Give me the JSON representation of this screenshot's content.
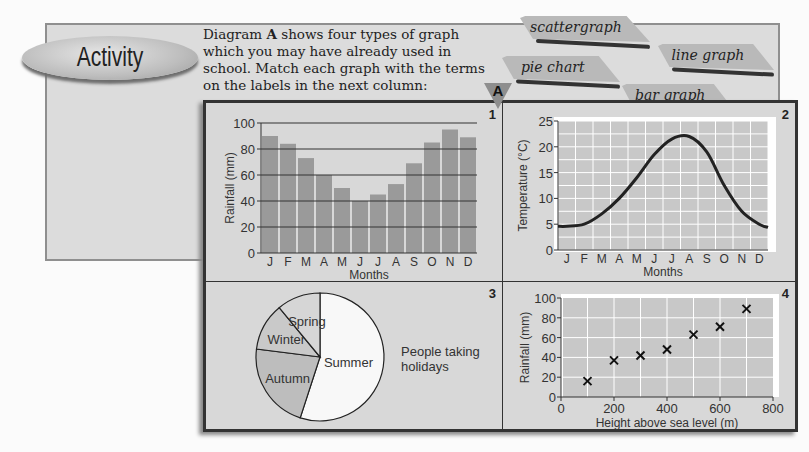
{
  "activity": {
    "label": "Activity"
  },
  "intro": {
    "text_before": "Diagram ",
    "bold": "A",
    "text_after": " shows four types of graph which you may have already used in school. Match each graph with the terms on the labels in the next column:"
  },
  "tags": [
    {
      "label": "scattergraph"
    },
    {
      "label": "pie chart"
    },
    {
      "label": "line graph"
    },
    {
      "label": "bar graph"
    }
  ],
  "diagram": {
    "marker": "A",
    "panels": [
      {
        "number": "1"
      },
      {
        "number": "2"
      },
      {
        "number": "3"
      },
      {
        "number": "4"
      }
    ]
  },
  "chart_data": [
    {
      "type": "bar",
      "title": "",
      "categories": [
        "J",
        "F",
        "M",
        "A",
        "M",
        "J",
        "J",
        "A",
        "S",
        "O",
        "N",
        "D"
      ],
      "values": [
        90,
        84,
        73,
        60,
        50,
        40,
        45,
        53,
        69,
        85,
        95,
        89
      ],
      "xlabel": "Months",
      "ylabel": "Rainfall (mm)",
      "ylim": [
        0,
        100
      ],
      "yticks": [
        0,
        20,
        40,
        60,
        80,
        100
      ],
      "grid": true,
      "color": "#9a9a9a"
    },
    {
      "type": "line",
      "title": "",
      "categories": [
        "J",
        "F",
        "M",
        "A",
        "M",
        "J",
        "J",
        "A",
        "S",
        "O",
        "N",
        "D"
      ],
      "values": [
        4.6,
        5,
        7,
        10,
        14,
        18.5,
        21.5,
        22,
        19,
        12.5,
        7.5,
        5
      ],
      "xlabel": "Months",
      "ylabel": "Temperature (°C)",
      "ylim": [
        0,
        25
      ],
      "yticks": [
        0,
        5,
        10,
        15,
        20,
        25
      ],
      "grid": true
    },
    {
      "type": "pie",
      "title": "People taking holidays",
      "categories": [
        "Summer",
        "Autumn",
        "Winter",
        "Spring"
      ],
      "values": [
        55,
        22,
        12,
        11
      ]
    },
    {
      "type": "scatter",
      "title": "",
      "x": [
        100,
        200,
        300,
        400,
        500,
        600,
        700
      ],
      "y": [
        16,
        37,
        42,
        48,
        63,
        71,
        89
      ],
      "xlabel": "Height above sea level (m)",
      "ylabel": "Rainfall (mm)",
      "xlim": [
        0,
        800
      ],
      "ylim": [
        0,
        100
      ],
      "xticks": [
        0,
        200,
        400,
        600,
        800
      ],
      "yticks": [
        0,
        20,
        40,
        60,
        80,
        100
      ],
      "grid": true
    }
  ]
}
